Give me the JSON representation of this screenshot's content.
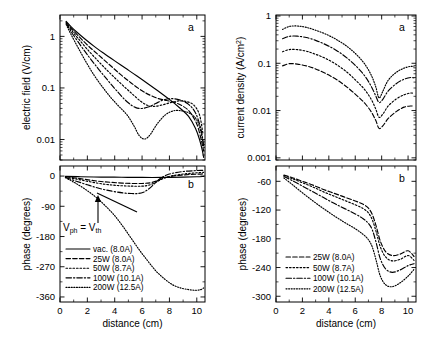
{
  "figure": {
    "panels": {
      "top_left_label": "a",
      "bottom_left_label": "b",
      "top_right_label": "a",
      "bottom_right_label": "b"
    },
    "annotation": {
      "text_main": "V",
      "text_sub1": "ph",
      "text_eq": " = V",
      "text_sub2": "th",
      "full": "Vph = Vth"
    }
  },
  "chart_data": [
    {
      "type": "line",
      "panel": "a (left)",
      "title": "",
      "xlabel": "distance (cm)",
      "ylabel": "electric field (V/cm)",
      "yscale": "log",
      "xlim": [
        0,
        10.6
      ],
      "ylim": [
        0.004,
        2.6
      ],
      "xticks": [
        0,
        2,
        4,
        6,
        8,
        10
      ],
      "yticks": [
        1,
        0.1,
        0.01
      ],
      "ytick_labels": [
        "1",
        "0.1",
        "0.01"
      ],
      "grid": false,
      "legend": "none",
      "series": [
        {
          "name": "vac. (8.0A)",
          "dash": "solid",
          "x": [
            0.45,
            0.8,
            1.2,
            1.8,
            2.5,
            3.2,
            4.0,
            4.8,
            5.6,
            6.4,
            7.2,
            8.0,
            8.8,
            9.4,
            9.9,
            10.2,
            10.4,
            10.5
          ],
          "y": [
            1.95,
            1.55,
            1.23,
            0.9,
            0.64,
            0.47,
            0.335,
            0.24,
            0.172,
            0.122,
            0.086,
            0.06,
            0.04,
            0.028,
            0.0165,
            0.01,
            0.0062,
            0.0045
          ]
        },
        {
          "name": "25W (8.0A)",
          "dash": "dashed",
          "x": [
            0.45,
            0.8,
            1.3,
            2.0,
            2.8,
            3.6,
            4.4,
            5.2,
            6.0,
            6.6,
            7.2,
            7.8,
            8.4,
            9.0,
            9.5,
            10.0,
            10.3,
            10.5
          ],
          "y": [
            1.9,
            1.45,
            1.05,
            0.68,
            0.44,
            0.285,
            0.185,
            0.125,
            0.088,
            0.072,
            0.062,
            0.057,
            0.052,
            0.044,
            0.034,
            0.02,
            0.0105,
            0.006
          ]
        },
        {
          "name": "50W (8.7A)",
          "dash": "dotted",
          "x": [
            0.45,
            0.8,
            1.3,
            2.0,
            2.8,
            3.6,
            4.4,
            5.2,
            5.9,
            6.4,
            6.9,
            7.5,
            8.1,
            8.7,
            9.3,
            9.8,
            10.2,
            10.45
          ],
          "y": [
            1.85,
            1.35,
            0.93,
            0.56,
            0.33,
            0.2,
            0.125,
            0.08,
            0.055,
            0.046,
            0.044,
            0.047,
            0.052,
            0.056,
            0.054,
            0.046,
            0.03,
            0.013
          ]
        },
        {
          "name": "100W (10.1A)",
          "dash": "dashdot",
          "x": [
            0.45,
            0.8,
            1.3,
            2.0,
            2.8,
            3.5,
            4.2,
            4.9,
            5.5,
            6.0,
            6.5,
            7.0,
            7.6,
            8.2,
            8.8,
            9.4,
            9.9,
            10.3,
            10.5
          ],
          "y": [
            1.8,
            1.25,
            0.8,
            0.44,
            0.235,
            0.14,
            0.085,
            0.054,
            0.042,
            0.04,
            0.043,
            0.05,
            0.059,
            0.062,
            0.058,
            0.048,
            0.033,
            0.016,
            0.0075
          ]
        },
        {
          "name": "200W (12.5A)",
          "dash": "finedot",
          "x": [
            0.45,
            0.8,
            1.3,
            1.9,
            2.5,
            3.1,
            3.7,
            4.3,
            4.9,
            5.4,
            5.8,
            6.2,
            6.6,
            7.1,
            7.7,
            8.3,
            8.9,
            9.5,
            10.0,
            10.3,
            10.5
          ],
          "y": [
            1.7,
            1.1,
            0.62,
            0.32,
            0.175,
            0.105,
            0.066,
            0.044,
            0.03,
            0.0185,
            0.0118,
            0.0102,
            0.0125,
            0.02,
            0.03,
            0.036,
            0.036,
            0.032,
            0.024,
            0.014,
            0.0075
          ]
        }
      ]
    },
    {
      "type": "line",
      "panel": "b (left)",
      "title": "",
      "xlabel": "distance (cm)",
      "ylabel": "phase (degrees)",
      "yscale": "linear",
      "xlim": [
        0,
        10.6
      ],
      "ylim": [
        -375,
        30
      ],
      "xticks": [
        0,
        2,
        4,
        6,
        8,
        10
      ],
      "yticks": [
        0,
        -90,
        -180,
        -270,
        -360
      ],
      "ytick_labels": [
        "0",
        "-90",
        "-180",
        "-270",
        "-360"
      ],
      "grid": false,
      "legend": "lower-left",
      "legend_items": [
        "vac. (8.0A)",
        "25W (8.0A)",
        "50W (8.7A)",
        "100W (10.1A)",
        "200W (12.5A)"
      ],
      "series": [
        {
          "name": "vac. (8.0A)",
          "dash": "solid",
          "x": [
            0.4,
            1.5,
            3.0,
            4.5,
            6.0,
            7.5,
            9.0,
            10.0,
            10.5
          ],
          "y": [
            -1,
            -2,
            -3,
            -3.5,
            -4,
            -4,
            -3,
            -2,
            -1
          ]
        },
        {
          "name": "25W (8.0A)",
          "dash": "dashed",
          "x": [
            0.4,
            1.2,
            2.2,
            3.2,
            4.2,
            5.2,
            6.0,
            6.6,
            7.1,
            7.6,
            8.2,
            8.9,
            9.6,
            10.2,
            10.5
          ],
          "y": [
            -2,
            -6,
            -12,
            -17,
            -20,
            -22,
            -22,
            -20,
            -14,
            -6,
            0,
            3,
            5,
            6,
            7
          ]
        },
        {
          "name": "50W (8.7A)",
          "dash": "dotted",
          "x": [
            0.4,
            1.2,
            2.2,
            3.2,
            4.2,
            5.2,
            6.0,
            6.5,
            7.0,
            7.5,
            8.1,
            8.8,
            9.5,
            10.1,
            10.5
          ],
          "y": [
            -3,
            -9,
            -17,
            -24,
            -28,
            -30,
            -30,
            -27,
            -19,
            -8,
            0,
            5,
            8,
            10,
            11
          ]
        },
        {
          "name": "100W (10.1A)",
          "dash": "dashdot",
          "x": [
            0.4,
            1.1,
            2.0,
            2.9,
            3.8,
            4.6,
            5.2,
            5.7,
            6.1,
            6.5,
            6.9,
            7.3,
            7.8,
            8.4,
            9.1,
            9.8,
            10.3,
            10.5
          ],
          "y": [
            -4,
            -14,
            -26,
            -37,
            -45,
            -50,
            -52,
            -52,
            -48,
            -38,
            -23,
            -8,
            3,
            10,
            14,
            16,
            17,
            17
          ]
        },
        {
          "name": "200W (12.5A)",
          "dash": "finedot",
          "x": [
            0.4,
            1.0,
            1.8,
            2.6,
            3.3,
            4.0,
            4.6,
            5.2,
            5.8,
            6.4,
            7.0,
            7.6,
            8.2,
            8.8,
            9.4,
            9.9,
            10.3,
            10.5
          ],
          "y": [
            -5,
            -18,
            -38,
            -62,
            -88,
            -118,
            -150,
            -185,
            -220,
            -252,
            -282,
            -305,
            -323,
            -333,
            -338,
            -340,
            -338,
            -333
          ]
        }
      ]
    },
    {
      "type": "line",
      "panel": "a (right)",
      "title": "",
      "xlabel": "distance (cm)",
      "ylabel": "current density (A/cm2)",
      "yscale": "log",
      "xlim": [
        0,
        10.6
      ],
      "ylim": [
        0.0009,
        1.05
      ],
      "xticks": [
        0,
        2,
        4,
        6,
        8,
        10
      ],
      "yticks": [
        1,
        0.1,
        0.01,
        0.001
      ],
      "ytick_labels": [
        "1",
        "0.1",
        "0.01",
        "0.001"
      ],
      "grid": false,
      "legend": "none",
      "series": [
        {
          "name": "25W (8.0A)",
          "dash": "dashed",
          "x": [
            0.5,
            1.0,
            1.6,
            2.3,
            3.0,
            3.8,
            4.6,
            5.4,
            6.1,
            6.7,
            7.2,
            7.55,
            7.8,
            8.1,
            8.5,
            9.1,
            9.7,
            10.2,
            10.45
          ],
          "y": [
            0.088,
            0.098,
            0.096,
            0.088,
            0.076,
            0.06,
            0.045,
            0.031,
            0.021,
            0.0145,
            0.0095,
            0.0062,
            0.0042,
            0.0048,
            0.0068,
            0.0095,
            0.0118,
            0.0125,
            0.0122
          ]
        },
        {
          "name": "50W (8.7A)",
          "dash": "dotted",
          "x": [
            0.5,
            1.0,
            1.6,
            2.3,
            3.0,
            3.8,
            4.6,
            5.4,
            6.1,
            6.7,
            7.2,
            7.55,
            7.8,
            8.1,
            8.5,
            9.1,
            9.7,
            10.2,
            10.45
          ],
          "y": [
            0.175,
            0.195,
            0.195,
            0.18,
            0.155,
            0.125,
            0.093,
            0.064,
            0.042,
            0.028,
            0.0175,
            0.0108,
            0.0072,
            0.0085,
            0.0125,
            0.0175,
            0.0215,
            0.0235,
            0.0228
          ]
        },
        {
          "name": "100W (10.1A)",
          "dash": "dashdot",
          "x": [
            0.5,
            1.0,
            1.6,
            2.3,
            3.0,
            3.8,
            4.6,
            5.4,
            6.1,
            6.7,
            7.2,
            7.55,
            7.8,
            8.1,
            8.5,
            9.1,
            9.7,
            10.2,
            10.45
          ],
          "y": [
            0.33,
            0.37,
            0.375,
            0.35,
            0.305,
            0.245,
            0.185,
            0.128,
            0.085,
            0.055,
            0.033,
            0.0205,
            0.0148,
            0.0175,
            0.026,
            0.037,
            0.046,
            0.05,
            0.049
          ]
        },
        {
          "name": "200W (12.5A)",
          "dash": "finedot",
          "x": [
            0.5,
            1.0,
            1.6,
            2.3,
            3.0,
            3.8,
            4.6,
            5.4,
            6.1,
            6.7,
            7.2,
            7.55,
            7.8,
            8.1,
            8.5,
            9.1,
            9.7,
            10.2,
            10.45
          ],
          "y": [
            0.52,
            0.6,
            0.615,
            0.575,
            0.5,
            0.41,
            0.315,
            0.225,
            0.152,
            0.098,
            0.057,
            0.032,
            0.0185,
            0.026,
            0.044,
            0.064,
            0.079,
            0.086,
            0.084
          ]
        }
      ]
    },
    {
      "type": "line",
      "panel": "b (right)",
      "title": "",
      "xlabel": "distance (cm)",
      "ylabel": "phase (degrees)",
      "yscale": "linear",
      "xlim": [
        0,
        10.6
      ],
      "ylim": [
        -312,
        -28
      ],
      "xticks": [
        0,
        2,
        4,
        6,
        8,
        10
      ],
      "yticks": [
        -60,
        -120,
        -180,
        -240,
        -300
      ],
      "ytick_labels": [
        "-60",
        "-120",
        "-180",
        "-240",
        "-300"
      ],
      "grid": false,
      "legend": "lower-left",
      "legend_items": [
        "25W (8.0A)",
        "50W (8.7A)",
        "100W (10.1A)",
        "200W (12.5A)"
      ],
      "series": [
        {
          "name": "25W (8.0A)",
          "dash": "dashed",
          "x": [
            0.6,
            1.2,
            2.0,
            2.8,
            3.6,
            4.4,
            5.2,
            6.0,
            6.6,
            7.0,
            7.3,
            7.6,
            7.9,
            8.3,
            8.8,
            9.4,
            10.0,
            10.45
          ],
          "y": [
            -47,
            -52,
            -60,
            -68,
            -77,
            -85,
            -93,
            -101,
            -108,
            -116,
            -130,
            -155,
            -185,
            -207,
            -215,
            -212,
            -205,
            -217
          ]
        },
        {
          "name": "50W (8.7A)",
          "dash": "dotted",
          "x": [
            0.6,
            1.2,
            2.0,
            2.8,
            3.6,
            4.4,
            5.2,
            6.0,
            6.6,
            7.0,
            7.3,
            7.6,
            7.9,
            8.3,
            8.8,
            9.4,
            10.0,
            10.45
          ],
          "y": [
            -48,
            -54,
            -63,
            -72,
            -82,
            -91,
            -100,
            -109,
            -117,
            -126,
            -141,
            -167,
            -197,
            -218,
            -226,
            -223,
            -215,
            -225
          ]
        },
        {
          "name": "100W (10.1A)",
          "dash": "dashdot",
          "x": [
            0.6,
            1.2,
            2.0,
            2.8,
            3.6,
            4.4,
            5.2,
            6.0,
            6.6,
            7.0,
            7.3,
            7.6,
            7.9,
            8.3,
            8.8,
            9.4,
            10.0,
            10.45
          ],
          "y": [
            -50,
            -58,
            -70,
            -82,
            -94,
            -106,
            -117,
            -128,
            -138,
            -148,
            -162,
            -190,
            -222,
            -243,
            -250,
            -245,
            -236,
            -232
          ]
        },
        {
          "name": "200W (12.5A)",
          "dash": "finedot",
          "x": [
            0.6,
            1.2,
            2.0,
            2.8,
            3.6,
            4.4,
            5.2,
            6.0,
            6.6,
            7.0,
            7.3,
            7.6,
            7.9,
            8.3,
            8.8,
            9.4,
            10.0,
            10.45
          ],
          "y": [
            -53,
            -66,
            -84,
            -101,
            -117,
            -132,
            -146,
            -159,
            -171,
            -182,
            -198,
            -227,
            -258,
            -276,
            -280,
            -272,
            -258,
            -244
          ]
        }
      ]
    }
  ]
}
